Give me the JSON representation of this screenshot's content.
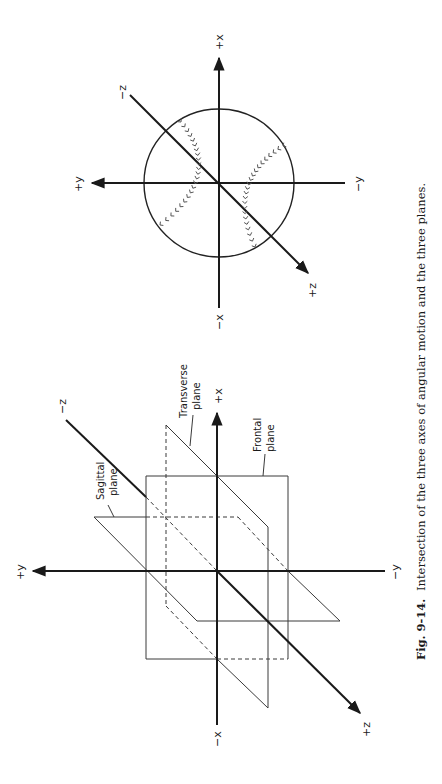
{
  "caption": {
    "figure_number": "Fig. 9-14.",
    "text": "Intersection of the three axes of angular motion and the three planes."
  },
  "planes_diagram": {
    "axis_labels": {
      "pos_x": "+x",
      "neg_x": "−x",
      "pos_y": "+y",
      "neg_y": "−y",
      "pos_z": "+z",
      "neg_z": "−z"
    },
    "plane_labels": {
      "sagittal": [
        "Sagittal",
        "plane"
      ],
      "transverse": [
        "Transverse",
        "plane"
      ],
      "frontal": [
        "Frontal",
        "plane"
      ]
    }
  },
  "baseball_diagram": {
    "axis_labels": {
      "pos_x": "+x",
      "neg_x": "−x",
      "pos_y": "+y",
      "neg_y": "−y",
      "pos_z": "+z",
      "neg_z": "−z"
    },
    "stitch_glyph": "»"
  }
}
